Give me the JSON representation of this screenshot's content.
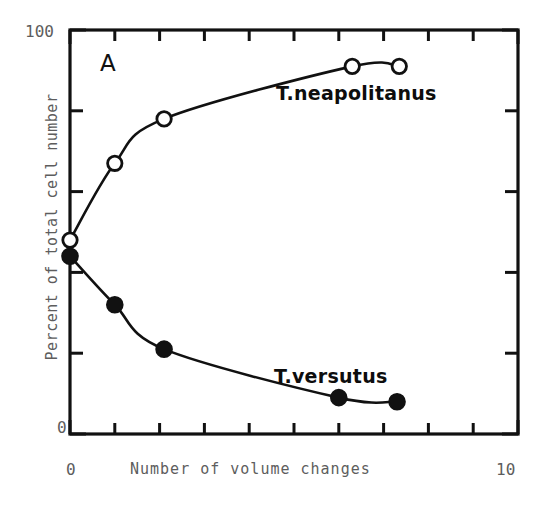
{
  "figure": {
    "panel_letter": "A"
  },
  "axes": {
    "x": {
      "title": "Number of volume changes",
      "min": 0,
      "max": 10,
      "tick_labels": [
        "0",
        "10"
      ],
      "tick_label_min": "0",
      "tick_label_max": "10",
      "tick_count": 11,
      "tick_values": [
        0,
        1,
        2,
        3,
        4,
        5,
        6,
        7,
        8,
        9,
        10
      ]
    },
    "y": {
      "title": "Percent of total cell number",
      "min": 0,
      "max": 100,
      "tick_labels": [
        "0",
        "100"
      ],
      "tick_label_min": "0",
      "tick_label_max": "100",
      "tick_count": 6,
      "tick_values": [
        0,
        20,
        40,
        60,
        80,
        100
      ]
    }
  },
  "annotations": {
    "neapolitanus": "T.neapolitanus",
    "versutus": "T.versutus"
  },
  "colors": {
    "line": "#111111",
    "frame": "#111111",
    "open_marker_fill": "#ffffff",
    "closed_marker_fill": "#111111",
    "label_text": "#5d5d5d",
    "background": "#ffffff"
  },
  "chart_data": {
    "type": "line",
    "title": "A",
    "xlabel": "Number of volume changes",
    "ylabel": "Percent of total cell number",
    "xlim": [
      0,
      10
    ],
    "ylim": [
      0,
      100
    ],
    "grid": false,
    "legend_position": "inline-annotation",
    "series": [
      {
        "name": "T.neapolitanus",
        "marker": "open-circle",
        "x": [
          0,
          1,
          2.1,
          6.3,
          7.35
        ],
        "y": [
          48,
          67,
          78,
          91,
          91
        ]
      },
      {
        "name": "T.versutus",
        "marker": "filled-circle",
        "x": [
          0,
          1,
          2.1,
          6.0,
          7.3
        ],
        "y": [
          44,
          32,
          21,
          9,
          8
        ]
      }
    ]
  }
}
